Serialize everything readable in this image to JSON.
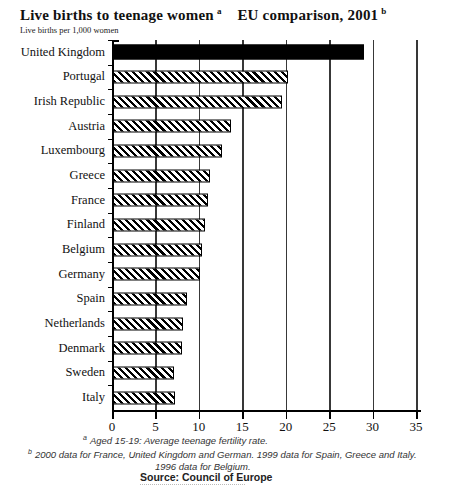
{
  "title": {
    "main": "Live births to teenage women",
    "sup_a": "a",
    "comparison": "EU comparison, 2001",
    "sup_b": "b"
  },
  "subtitle": "Live births per 1,000 women",
  "chart_data": {
    "type": "bar",
    "orientation": "horizontal",
    "xlabel": "Live births per 1,000 women",
    "ylabel": "",
    "xlim": [
      0,
      35
    ],
    "xticks": [
      0,
      5,
      10,
      15,
      20,
      25,
      30,
      35
    ],
    "grid": "vertical",
    "legend": "none",
    "categories": [
      "United Kingdom",
      "Portugal",
      "Irish Republic",
      "Austria",
      "Luxembourg",
      "Greece",
      "France",
      "Finland",
      "Belgium",
      "Germany",
      "Spain",
      "Netherlands",
      "Denmark",
      "Sweden",
      "Italy"
    ],
    "values": [
      28.5,
      19.9,
      19.2,
      13.4,
      12.4,
      11.0,
      10.8,
      10.4,
      10.1,
      9.9,
      8.4,
      7.9,
      7.8,
      6.9,
      7.0
    ],
    "styles": [
      "solid",
      "hatch",
      "hatch",
      "hatch",
      "hatch",
      "hatch",
      "hatch",
      "hatch",
      "hatch",
      "hatch",
      "hatch",
      "hatch",
      "hatch",
      "hatch",
      "hatch"
    ]
  },
  "colors": {
    "bar_solid": "#000000",
    "bar_hatch_stripe": "#000000",
    "gridline": "#383838",
    "axis": "#000000"
  },
  "footnotes": {
    "a_marker": "a",
    "a": "Aged 15-19: Average teenage fertility rate.",
    "b_marker": "b",
    "b": "2000 data for France, United Kingdom and German.  1999 data for Spain, Greece and Italy.",
    "c": "1996 data for Belgium."
  },
  "source": "Source: Council of Europe"
}
